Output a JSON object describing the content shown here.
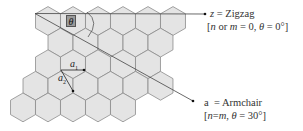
{
  "diagram": {
    "type": "graphene-hexagonal-lattice",
    "colors": {
      "hex_fill": "#e4e4e4",
      "hex_stroke": "#8c8c8c",
      "line": "#333333",
      "theta_box": "#9a9a9a",
      "text": "#333333"
    },
    "hex_radius": 14.4,
    "rows": [
      {
        "y": 21,
        "x": [
          48,
          73,
          98,
          123,
          148,
          173
        ]
      },
      {
        "y": 42.6,
        "x": [
          60.5,
          85.5,
          110.5,
          135.5,
          160.5
        ]
      },
      {
        "y": 64.2,
        "x": [
          48,
          73,
          98,
          123,
          148
        ]
      },
      {
        "y": 85.8,
        "x": [
          35.5,
          60.5,
          85.5,
          110.5,
          135.5,
          160.5
        ]
      },
      {
        "y": 107.4,
        "x": [
          23,
          48,
          73,
          98,
          123
        ]
      }
    ],
    "theta_label": "θ",
    "vectors": {
      "a1": {
        "label": "a",
        "sub": "1"
      },
      "a2": {
        "label": "a",
        "sub": "2"
      }
    },
    "zigzag": {
      "symbol": "z",
      "eq": " = Zigzag",
      "condition_open": "[",
      "condition_n": "n",
      "condition_or": " or ",
      "condition_m": "m",
      "condition_mid": " = 0, ",
      "condition_theta": "θ",
      "condition_end": " = 0°]"
    },
    "armchair": {
      "symbol": "a",
      "eq": "  = Armchair",
      "condition_open": "[",
      "condition_n": "n",
      "condition_eq": "=",
      "condition_m": "m",
      "condition_comma": ", ",
      "condition_theta": "θ",
      "condition_end": " = 30°]"
    }
  }
}
